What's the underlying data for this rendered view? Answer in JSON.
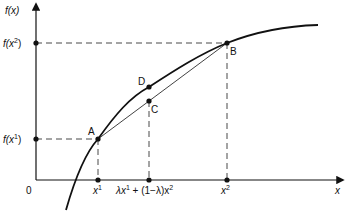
{
  "diagram": {
    "axes": {
      "y_label": "f(x)",
      "x_label": "x",
      "origin_label": "0"
    },
    "y_ticks": [
      {
        "label_base": "f(x",
        "label_sup": "2",
        "label_end": ")"
      },
      {
        "label_base": "f(x",
        "label_sup": "1",
        "label_end": ")"
      }
    ],
    "x_ticks": [
      {
        "label_base": "x",
        "label_sup": "1"
      },
      {
        "label": "λx¹ + (1−λ)x²",
        "part1": "λx",
        "sup1": "1",
        "part2": " + (1−λ)x",
        "sup2": "2"
      },
      {
        "label_base": "x",
        "label_sup": "2"
      }
    ],
    "points": [
      {
        "name": "A",
        "label": "A"
      },
      {
        "name": "B",
        "label": "B"
      },
      {
        "name": "C",
        "label": "C"
      },
      {
        "name": "D",
        "label": "D"
      }
    ],
    "colors": {
      "stroke": "#111111",
      "dashed": "#333333",
      "background": "#ffffff"
    }
  }
}
